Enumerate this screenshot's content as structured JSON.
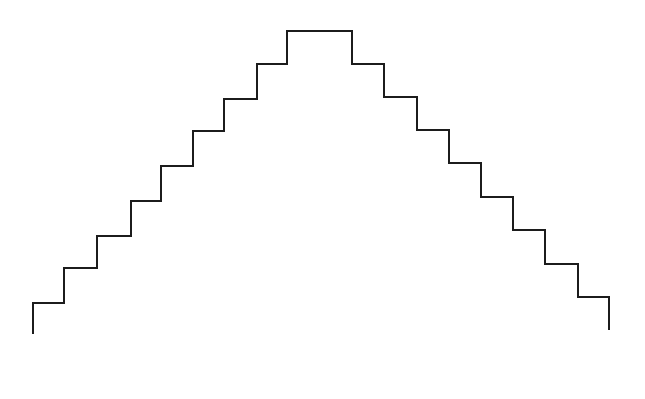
{
  "canvas": {
    "width": 645,
    "height": 399,
    "background_color": "#ffffff",
    "stroke_color": "#1c1c1c",
    "stroke_width": 2
  },
  "figure": {
    "name": "symmetric-staircase-pyramid-outline",
    "step_count_ascending": 8,
    "step_count_descending": 8,
    "apex": {
      "x_left": 287,
      "x_right": 352,
      "y": 31
    },
    "left_terminus": {
      "x": 33,
      "y": 334
    },
    "right_terminus": {
      "x": 609,
      "y": 330
    },
    "points": [
      [
        33,
        334
      ],
      [
        33,
        303
      ],
      [
        64,
        303
      ],
      [
        64,
        268
      ],
      [
        97,
        268
      ],
      [
        97,
        236
      ],
      [
        131,
        236
      ],
      [
        131,
        201
      ],
      [
        161,
        201
      ],
      [
        161,
        166
      ],
      [
        193,
        166
      ],
      [
        193,
        131
      ],
      [
        224,
        131
      ],
      [
        224,
        99
      ],
      [
        257,
        99
      ],
      [
        257,
        64
      ],
      [
        287,
        64
      ],
      [
        287,
        31
      ],
      [
        352,
        31
      ],
      [
        352,
        64
      ],
      [
        384,
        64
      ],
      [
        384,
        97
      ],
      [
        417,
        97
      ],
      [
        417,
        130
      ],
      [
        449,
        130
      ],
      [
        449,
        163
      ],
      [
        481,
        163
      ],
      [
        481,
        197
      ],
      [
        513,
        197
      ],
      [
        513,
        230
      ],
      [
        545,
        230
      ],
      [
        545,
        264
      ],
      [
        578,
        264
      ],
      [
        578,
        297
      ],
      [
        609,
        297
      ],
      [
        609,
        330
      ]
    ]
  }
}
